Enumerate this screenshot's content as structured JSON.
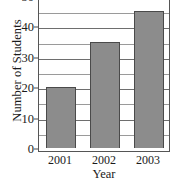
{
  "chart_data": {
    "type": "bar",
    "title": "",
    "subtitle": "",
    "categories": [
      "2001",
      "2002",
      "2003"
    ],
    "values": [
      20,
      35,
      45
    ],
    "xlabel": "Year",
    "ylabel": "Number of Students",
    "ylim": [
      0,
      50
    ],
    "ytick_labels": [
      "0",
      "10",
      "20",
      "30",
      "40",
      "50"
    ],
    "ytick_values": [
      0,
      10,
      20,
      30,
      40,
      50
    ],
    "gridlines": {
      "visible": true,
      "axis": "y",
      "interval": 5,
      "values": [
        5,
        10,
        15,
        20,
        25,
        30,
        35,
        40,
        45,
        50
      ]
    },
    "legend": null,
    "annotations": [],
    "colors": {
      "bar_fill": "#8c8c8c",
      "bar_edge": "#4a4a4a",
      "grid": "#9a9a9a",
      "axis": "#555555",
      "text": "#1a1a1a",
      "background": "#ffffff"
    }
  }
}
